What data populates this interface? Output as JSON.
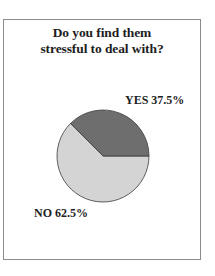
{
  "chart_data": {
    "type": "pie",
    "title": "Do you find them stressful to deal with?",
    "title_lines": [
      "Do you find them",
      "stressful to deal with?"
    ],
    "categories": [
      "YES",
      "NO"
    ],
    "values": [
      37.5,
      62.5
    ],
    "labels": [
      "YES 37.5%",
      "NO 62.5%"
    ],
    "colors": [
      "#6e6e6e",
      "#d4d4d4"
    ],
    "legend": "none (inline labels)"
  }
}
